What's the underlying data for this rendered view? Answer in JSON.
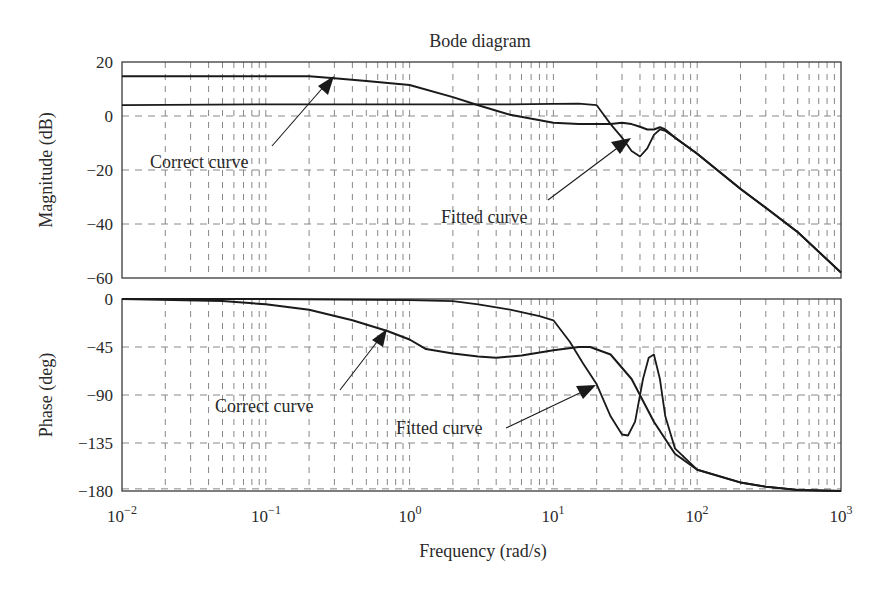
{
  "chart_data": [
    {
      "type": "line",
      "panel": "magnitude",
      "title": "Bode diagram",
      "xlabel": "",
      "ylabel": "Magnitude (dB)",
      "xscale": "log",
      "xlim": [
        0.01,
        1000
      ],
      "ylim": [
        -60,
        20
      ],
      "yticks": [
        20,
        0,
        -20,
        -40,
        -60
      ],
      "grid": true,
      "series": [
        {
          "name": "Correct curve",
          "x": [
            0.01,
            0.1,
            0.2,
            0.3,
            0.5,
            1,
            2,
            3,
            5,
            10,
            15,
            20,
            25,
            30,
            35,
            40,
            45,
            50,
            55,
            60,
            70,
            100,
            200,
            300,
            500,
            1000
          ],
          "values": [
            14.7,
            14.7,
            14.7,
            14,
            13,
            11.5,
            7,
            4,
            0.5,
            -2.5,
            -3,
            -3,
            -3,
            -2.5,
            -3,
            -4,
            -5,
            -5,
            -4.2,
            -5,
            -8,
            -14,
            -27,
            -34,
            -43,
            -58
          ]
        },
        {
          "name": "Fitted curve",
          "x": [
            0.01,
            0.1,
            1,
            5,
            10,
            15,
            20,
            22,
            25,
            30,
            35,
            40,
            45,
            50,
            55,
            60,
            70,
            100,
            200,
            300,
            500,
            1000
          ],
          "values": [
            4,
            4.3,
            4.3,
            4.3,
            4.5,
            4.6,
            4,
            1,
            -3,
            -8,
            -13,
            -15,
            -12,
            -7,
            -5,
            -5.5,
            -8,
            -14,
            -27,
            -34,
            -43,
            -58
          ]
        }
      ],
      "annotations": [
        {
          "text": "Correct curve",
          "arrow_to": [
            0.3,
            14
          ]
        },
        {
          "text": "Fitted curve",
          "arrow_to": [
            35,
            -8
          ]
        }
      ]
    },
    {
      "type": "line",
      "panel": "phase",
      "xlabel": "Frequency (rad/s)",
      "ylabel": "Phase (deg)",
      "xscale": "log",
      "xlim": [
        0.01,
        1000
      ],
      "ylim": [
        -180,
        0
      ],
      "xticks": [
        "10^-2",
        "10^-1",
        "10^0",
        "10^1",
        "10^2",
        "10^3"
      ],
      "yticks": [
        0,
        -45,
        -90,
        -135,
        -180
      ],
      "grid": true,
      "series": [
        {
          "name": "Correct curve",
          "x": [
            0.01,
            0.05,
            0.1,
            0.2,
            0.4,
            0.7,
            1,
            1.3,
            2,
            3,
            4,
            6,
            10,
            15,
            18,
            25,
            35,
            50,
            70,
            100,
            200,
            300,
            500,
            1000
          ],
          "values": [
            0,
            -2,
            -5,
            -10,
            -20,
            -30,
            -38,
            -47,
            -51,
            -54,
            -55,
            -53,
            -48,
            -45,
            -45,
            -52,
            -75,
            -115,
            -145,
            -160,
            -172,
            -176,
            -179,
            -180
          ]
        },
        {
          "name": "Fitted curve",
          "x": [
            0.01,
            0.1,
            1,
            2,
            3,
            5,
            8,
            10,
            13,
            16,
            20,
            25,
            30,
            33,
            37,
            42,
            46,
            50,
            55,
            60,
            70,
            100,
            200,
            300,
            500,
            1000
          ],
          "values": [
            0,
            0,
            -1,
            -2,
            -5,
            -10,
            -16,
            -20,
            -40,
            -60,
            -80,
            -110,
            -127,
            -128,
            -115,
            -75,
            -55,
            -52,
            -75,
            -110,
            -140,
            -160,
            -172,
            -176,
            -179,
            -180
          ]
        }
      ],
      "annotations": [
        {
          "text": "Correct curve",
          "arrow_to": [
            0.7,
            -30
          ]
        },
        {
          "text": "Fitted curve",
          "arrow_to": [
            20,
            -80
          ]
        }
      ]
    }
  ],
  "figure": {
    "title": "Bode diagram",
    "mag_ylabel": "Magnitude (dB)",
    "phase_ylabel": "Phase (deg)",
    "xlabel": "Frequency (rad/s)",
    "mag_ticks": [
      "20",
      "0",
      "−20",
      "−40",
      "−60"
    ],
    "phase_ticks": [
      "0",
      "−45",
      "−90",
      "−135",
      "−180"
    ],
    "x_tick_bases": [
      "10",
      "10",
      "10",
      "10",
      "10",
      "10"
    ],
    "x_tick_exps": [
      "−2",
      "−1",
      "0",
      "1",
      "2",
      "3"
    ],
    "mag_annot_correct": "Correct curve",
    "mag_annot_fitted": "Fitted curve",
    "phase_annot_correct": "Correct curve",
    "phase_annot_fitted": "Fitted curve",
    "line_color": "#1a1a1a",
    "grid_color": "#6a6a6a"
  }
}
